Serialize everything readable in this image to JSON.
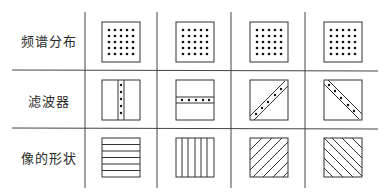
{
  "figure": {
    "rows": [
      {
        "label": "频谱分布",
        "key": "spectrum"
      },
      {
        "label": "滤波器",
        "key": "filter"
      },
      {
        "label": "像的形状",
        "key": "image_shape"
      }
    ],
    "columns": [
      {
        "spectrum": "5x5 dot grid",
        "filter": "vertical slit with dots",
        "image_shape": "horizontal stripes"
      },
      {
        "spectrum": "5x5 dot grid",
        "filter": "horizontal slit with dots",
        "image_shape": "vertical stripes"
      },
      {
        "spectrum": "5x5 dot grid",
        "filter": "diagonal slit (bottom-left to top-right) with dots",
        "image_shape": "diagonal stripes (/)"
      },
      {
        "spectrum": "5x5 dot grid",
        "filter": "diagonal slit (top-left to bottom-right) with dots",
        "image_shape": "diagonal stripes (\\)"
      }
    ],
    "colors": {
      "line": "#333333",
      "dot": "#111111",
      "background": "#ffffff"
    }
  }
}
